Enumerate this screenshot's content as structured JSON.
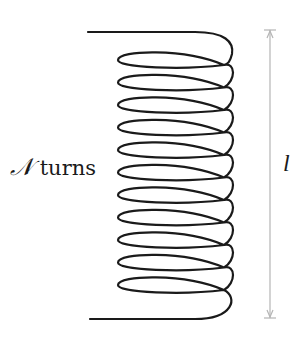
{
  "diagram": {
    "turns_label_symbol": "𝒩",
    "turns_label_text": " turns",
    "length_label": "l",
    "turn_count": 11,
    "colors": {
      "wire": "#1a1a1a",
      "dimension_line": "#b5b5b5",
      "background": "#ffffff"
    },
    "coil": {
      "lead_top": {
        "x_start": 88,
        "y": 32
      },
      "lead_bottom": {
        "x_start": 90,
        "y": 319
      },
      "first_loop_y": 60,
      "loop_spacing": 22.5,
      "left_tip_x": 118,
      "right_x": 232
    },
    "dimension": {
      "x": 270,
      "y_top": 30,
      "y_bottom": 318
    }
  }
}
